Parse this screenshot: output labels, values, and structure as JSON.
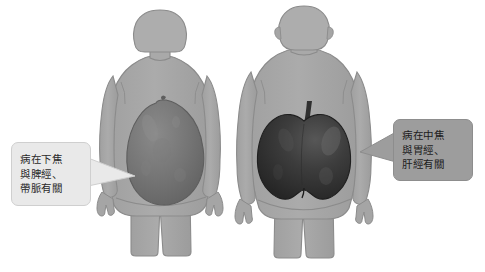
{
  "diagram": {
    "background_color": "#ffffff",
    "body_fill": "#a8a8a8",
    "body_outline": "#8e8e8e"
  },
  "figures": [
    {
      "id": "pear-body-figure",
      "sex": "female",
      "shape_name": "pear-shape",
      "fruit": "pear",
      "fruit_color": "#6e6e6e",
      "position": "left"
    },
    {
      "id": "apple-body-figure",
      "sex": "male",
      "shape_name": "apple-shape",
      "fruit": "apple",
      "fruit_color": "#3a3a3a",
      "position": "right"
    }
  ],
  "callouts": {
    "left": {
      "name": "pear-shape-callout",
      "background": "#e9e9e9",
      "lines": [
        "病在下焦",
        "與脾經、",
        "帶脈有關"
      ],
      "line1": "病在下焦",
      "line2": "與脾經、",
      "line3": "帶脈有關"
    },
    "right": {
      "name": "apple-shape-callout",
      "background": "#9d9d9d",
      "lines": [
        "病在中焦",
        "與胃經、",
        "肝經有關"
      ],
      "line1": "病在中焦",
      "line2": "與胃經、",
      "line3": "肝經有關"
    }
  }
}
